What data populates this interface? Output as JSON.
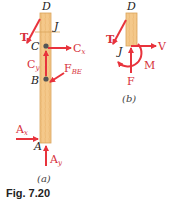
{
  "figure": {
    "caption": "Fig. 7.20",
    "colors": {
      "force": "#e8333c",
      "member_fill": "#f4c88a",
      "member_stroke": "#d9a45a",
      "point": "#555555",
      "text_dark": "#222222"
    }
  },
  "panel_a": {
    "caption": "(a)",
    "points": {
      "D": "D",
      "J": "J",
      "C": "C",
      "B": "B",
      "A": "A"
    },
    "forces": {
      "T": "T",
      "Cx": {
        "main": "C",
        "sub": "x"
      },
      "Cy": {
        "main": "C",
        "sub": "y"
      },
      "FBE": {
        "main": "F",
        "sub": "BE"
      },
      "Ax": {
        "main": "A",
        "sub": "x"
      },
      "Ay": {
        "main": "A",
        "sub": "y"
      }
    }
  },
  "panel_b": {
    "caption": "(b)",
    "points": {
      "D": "D",
      "J": "J"
    },
    "forces": {
      "T": "T",
      "V": "V",
      "M": "M",
      "F": "F"
    }
  }
}
